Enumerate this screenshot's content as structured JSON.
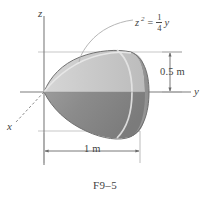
{
  "figure": {
    "caption": "F9–5",
    "axes": {
      "z_label": "z",
      "y_label": "y",
      "x_label": "x"
    },
    "equation": {
      "variable": "z",
      "exponent": "2",
      "equals": "=",
      "fraction_numerator": "1",
      "fraction_denominator": "4",
      "rhs_variable": "y",
      "plain": "z² = (1/4) y"
    },
    "dimensions": [
      {
        "name": "height",
        "label": "0.5 m",
        "value": 0.5,
        "unit": "m",
        "axis": "z"
      },
      {
        "name": "width",
        "label": "1 m",
        "value": 1,
        "unit": "m",
        "axis": "y"
      }
    ],
    "colors": {
      "body_upper": "#c9c9c9",
      "body_lower": "#8a8a8a",
      "end_cap": "#9a9a9a",
      "end_cap_shadow": "#777777",
      "outline": "#6e6e6e",
      "axis": "#7a7a7a",
      "guide": "#b4b4b4",
      "text": "#444444",
      "background": "#ffffff"
    },
    "shape": {
      "type": "paraboloid-of-revolution",
      "description": "Solid formed by revolving z² = (1/4)y about the y axis, vertex at origin, extending 1 m along +y with radius 0.5 m at the end"
    }
  }
}
